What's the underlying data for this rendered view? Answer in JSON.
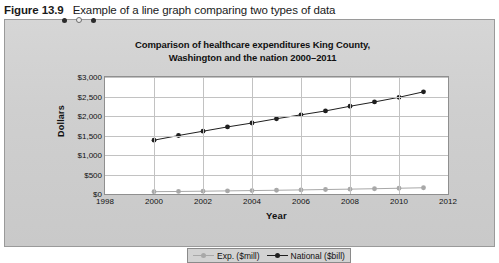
{
  "caption": {
    "figure_number": "Figure 13.9",
    "text": "Example of a line graph comparing two types of data"
  },
  "panel": {
    "dots": [
      "dark",
      "light",
      "dark"
    ],
    "background_color": "#d0d0d0",
    "border_color": "#9a9a9a"
  },
  "chart_data": {
    "type": "line",
    "title": "Comparison of healthcare expenditures King County, Washington and the nation 2000–2011",
    "title_line1": "Comparison of healthcare expenditures King County,",
    "title_line2": "Washington and the nation 2000–2011",
    "xlabel": "Year",
    "ylabel": "Dollars",
    "xlim": [
      1998,
      2012
    ],
    "ylim": [
      0,
      3000
    ],
    "xticks": [
      1998,
      2000,
      2002,
      2004,
      2006,
      2008,
      2010,
      2012
    ],
    "xtick_labels": [
      "1998",
      "2000",
      "2002",
      "2004",
      "2006",
      "2008",
      "2010",
      "2012"
    ],
    "yticks": [
      0,
      500,
      1000,
      1500,
      2000,
      2500,
      3000
    ],
    "ytick_labels": [
      "$0",
      "$500",
      "$1,000",
      "$1,500",
      "$2,000",
      "$2,500",
      "$3,000"
    ],
    "grid": true,
    "legend_position": "bottom",
    "x": [
      2000,
      2001,
      2002,
      2003,
      2004,
      2005,
      2006,
      2007,
      2008,
      2009,
      2010,
      2011
    ],
    "series": [
      {
        "name": "Exp. ($mill)",
        "color": "#a8a8a8",
        "marker": "circle",
        "values": [
          60,
          65,
          72,
          80,
          88,
          96,
          105,
          115,
          125,
          135,
          148,
          160
        ]
      },
      {
        "name": "National ($bill)",
        "color": "#1f1f1f",
        "marker": "circle",
        "values": [
          1380,
          1500,
          1610,
          1720,
          1820,
          1930,
          2030,
          2130,
          2250,
          2360,
          2480,
          2620
        ]
      }
    ]
  },
  "legend": {
    "items": [
      {
        "label": "Exp. ($mill)",
        "color": "#a8a8a8"
      },
      {
        "label": "National ($bill)",
        "color": "#1f1f1f"
      }
    ]
  }
}
